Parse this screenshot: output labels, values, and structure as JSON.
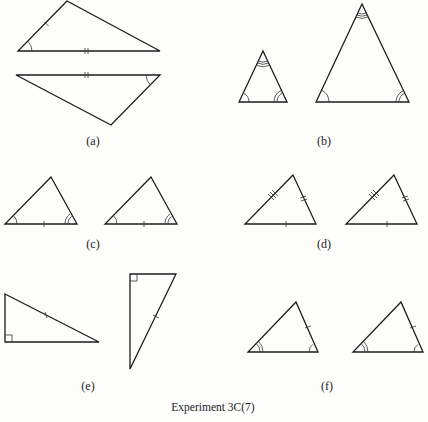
{
  "figure": {
    "caption": "Experiment 3C(7)",
    "panels": [
      {
        "id": "a",
        "label": "(a)",
        "description": "Two congruent triangles (SAS): one side single tick, included side double tick, included angle single arc"
      },
      {
        "id": "b",
        "label": "(b)",
        "description": "Two similar triangles (AAA): triple arc apex, single arc left, double arc right"
      },
      {
        "id": "c",
        "label": "(c)",
        "description": "Two congruent triangles (ASA): single arc left, double arc right, base single tick"
      },
      {
        "id": "d",
        "label": "(d)",
        "description": "Two congruent triangles (SSS): single, double, triple ticks"
      },
      {
        "id": "e",
        "label": "(e)",
        "description": "Two right triangles (RHS): right angle square, hypotenuse single tick"
      },
      {
        "id": "f",
        "label": "(f)",
        "description": "Two triangles (AAS): double arc left, single arc right, right side single tick"
      }
    ]
  },
  "colors": {
    "line": "#1c1c1c",
    "background": "#fdfdfc"
  }
}
